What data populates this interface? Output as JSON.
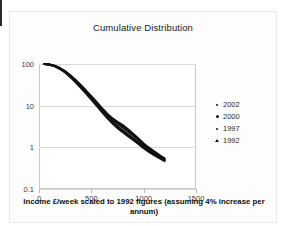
{
  "chart_data": {
    "type": "line",
    "title": "Cumulative Distribution",
    "xlabel": "Income £/week scaled to 1992 figures (assuming 4% increase per annum)",
    "ylabel": "",
    "yscale": "log",
    "xlim": [
      0,
      1500
    ],
    "ylim": [
      0.1,
      100
    ],
    "xticks": [
      "0",
      "500",
      "1000",
      "1500"
    ],
    "xtick_values": [
      0,
      500,
      1000,
      1500
    ],
    "yticks": [
      "100",
      "10",
      "1",
      "0.1"
    ],
    "ytick_values": [
      100,
      10,
      1,
      0.1
    ],
    "grid": true,
    "legend_position": "right",
    "series": [
      {
        "name": "2002",
        "marker": "dot-small",
        "color": "#111111",
        "x": [
          50,
          100,
          150,
          200,
          250,
          300,
          350,
          400,
          450,
          500,
          550,
          600,
          650,
          700,
          750,
          800,
          850,
          900,
          950,
          1000,
          1050,
          1100,
          1150,
          1200
        ],
        "y": [
          100,
          97,
          90,
          79,
          66,
          52,
          40,
          30,
          22,
          16,
          11.5,
          8.2,
          6.0,
          4.6,
          3.7,
          3.0,
          2.4,
          1.9,
          1.5,
          1.15,
          0.92,
          0.76,
          0.62,
          0.52
        ]
      },
      {
        "name": "2000",
        "marker": "dot-large",
        "color": "#111111",
        "x": [
          50,
          100,
          150,
          200,
          250,
          300,
          350,
          400,
          450,
          500,
          550,
          600,
          650,
          700,
          750,
          800,
          850,
          900,
          950,
          1000,
          1050,
          1100,
          1150,
          1200
        ],
        "y": [
          100,
          96.5,
          89,
          77.5,
          64,
          50,
          38,
          28,
          20.5,
          14.8,
          10.6,
          7.6,
          5.5,
          4.1,
          3.2,
          2.55,
          2.05,
          1.65,
          1.32,
          1.05,
          0.85,
          0.7,
          0.58,
          0.49
        ]
      },
      {
        "name": "1997",
        "marker": "dot-tiny",
        "color": "#111111",
        "x": [
          50,
          100,
          150,
          200,
          250,
          300,
          350,
          400,
          450,
          500,
          550,
          600,
          650,
          700,
          750,
          800,
          850,
          900,
          950,
          1000,
          1050,
          1100,
          1150,
          1200
        ],
        "y": [
          100,
          97.5,
          91,
          80,
          67,
          53.5,
          41,
          31,
          23,
          16.8,
          12.2,
          8.8,
          6.5,
          5.0,
          4.1,
          3.4,
          2.7,
          2.1,
          1.62,
          1.24,
          0.98,
          0.8,
          0.65,
          0.54
        ]
      },
      {
        "name": "1992",
        "marker": "triangle",
        "color": "#111111",
        "x": [
          50,
          100,
          150,
          200,
          250,
          300,
          350,
          400,
          450,
          500,
          550,
          600,
          650,
          700,
          750,
          800,
          850,
          900,
          950,
          1000,
          1050,
          1100,
          1150,
          1200
        ],
        "y": [
          100,
          96,
          88,
          76,
          62.5,
          48.5,
          36.5,
          27,
          19.5,
          14,
          10.0,
          7.1,
          5.1,
          3.8,
          2.9,
          2.3,
          1.85,
          1.5,
          1.2,
          0.96,
          0.78,
          0.65,
          0.55,
          0.47
        ]
      }
    ]
  }
}
